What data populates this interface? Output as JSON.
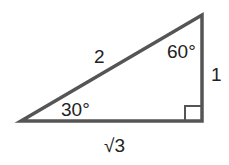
{
  "diagram": {
    "line_color": "#555555",
    "sides": {
      "hypotenuse": "2",
      "short_leg": "1",
      "long_leg": "√3"
    },
    "angles": {
      "left": "30°",
      "top": "60°",
      "right_angle": "90°"
    }
  }
}
